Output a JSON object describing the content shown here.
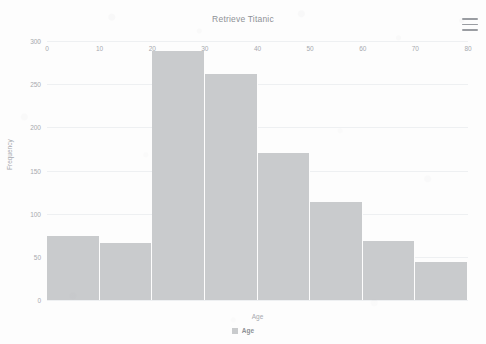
{
  "header": {
    "title": "Retrieve Titanic",
    "menu_icon": "hamburger-menu-icon"
  },
  "legend": {
    "position": "bottom",
    "entries": [
      {
        "label": "Age",
        "color": "#c9cbcd"
      }
    ]
  },
  "colors": {
    "bar_fill": "#c9cbcd",
    "gridline": "#eef0f2",
    "axis_text": "#a7aaaf",
    "title_text": "#8e9196",
    "background": "#fdfdfd"
  },
  "chart_data": {
    "type": "bar",
    "title": "Retrieve Titanic",
    "subtitle": "",
    "xlabel": "Age",
    "ylabel": "Frequency",
    "xlim": [
      0,
      80
    ],
    "ylim": [
      0,
      300
    ],
    "grid": true,
    "legend_position": "bottom",
    "bin_width": 10,
    "categories": [
      "0-10",
      "10-20",
      "20-30",
      "30-40",
      "40-50",
      "50-60",
      "60-70",
      "70-80",
      "80-90"
    ],
    "x_tick_labels": [
      "0",
      "10",
      "20",
      "30",
      "40",
      "50",
      "60",
      "70",
      "80"
    ],
    "x_ticks": [
      0,
      10,
      20,
      30,
      40,
      50,
      60,
      70,
      80
    ],
    "y_tick_labels": [
      "0",
      "50",
      "100",
      "150",
      "200",
      "250",
      "300"
    ],
    "y_ticks": [
      0,
      50,
      100,
      150,
      200,
      250,
      300
    ],
    "series": [
      {
        "name": "Age",
        "color": "#c9cbcd",
        "bin_starts": [
          0,
          10,
          20,
          30,
          40,
          50,
          60,
          70,
          80
        ],
        "values": [
          74,
          66,
          288,
          262,
          170,
          113,
          68,
          44,
          10
        ]
      }
    ]
  }
}
